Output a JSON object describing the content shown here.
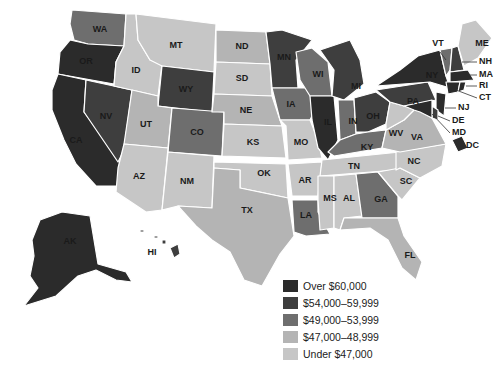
{
  "map": {
    "type": "choropleth",
    "region": "United States",
    "legend": [
      {
        "label": "Over $60,000",
        "color": "#2b2b2b"
      },
      {
        "label": "$54,000–59,999",
        "color": "#3e3e3e"
      },
      {
        "label": "$49,000–53,999",
        "color": "#6e6e6e"
      },
      {
        "label": "$47,000–48,999",
        "color": "#b4b4b4"
      },
      {
        "label": "Under $47,000",
        "color": "#c6c6c6"
      }
    ],
    "states": {
      "WA": 2,
      "OR": 0,
      "CA": 0,
      "NV": 1,
      "ID": 4,
      "MT": 4,
      "WY": 1,
      "UT": 3,
      "AZ": 4,
      "CO": 2,
      "NM": 4,
      "ND": 3,
      "SD": 4,
      "NE": 3,
      "KS": 4,
      "OK": 4,
      "TX": 3,
      "MN": 1,
      "IA": 2,
      "MO": 4,
      "AR": 4,
      "LA": 2,
      "WI": 2,
      "IL": 0,
      "MI": 1,
      "IN": 2,
      "OH": 1,
      "KY": 2,
      "TN": 4,
      "MS": 4,
      "AL": 4,
      "GA": 2,
      "FL": 3,
      "SC": 4,
      "NC": 4,
      "VA": 3,
      "WV": 4,
      "PA": 1,
      "NY": 0,
      "VT": 2,
      "NH": 1,
      "ME": 4,
      "MA": 0,
      "RI": 0,
      "CT": 0,
      "NJ": 0,
      "DE": 1,
      "MD": 0,
      "DC": 0,
      "AK": 0,
      "HI": 1
    },
    "labels": {
      "WA": "WA",
      "OR": "OR",
      "CA": "CA",
      "NV": "NV",
      "ID": "ID",
      "MT": "MT",
      "WY": "WY",
      "UT": "UT",
      "AZ": "AZ",
      "CO": "CO",
      "NM": "NM",
      "ND": "ND",
      "SD": "SD",
      "NE": "NE",
      "KS": "KS",
      "OK": "OK",
      "TX": "TX",
      "MN": "MN",
      "IA": "IA",
      "MO": "MO",
      "AR": "AR",
      "LA": "LA",
      "WI": "WI",
      "IL": "IL",
      "MI": "MI",
      "IN": "IN",
      "OH": "OH",
      "KY": "KY",
      "TN": "TN",
      "MS": "MS",
      "AL": "AL",
      "GA": "GA",
      "FL": "FL",
      "SC": "SC",
      "NC": "NC",
      "VA": "VA",
      "WV": "WV",
      "PA": "PA",
      "NY": "NY",
      "VT": "VT",
      "NH": "NH",
      "ME": "ME",
      "MA": "MA",
      "RI": "RI",
      "CT": "CT",
      "NJ": "NJ",
      "DE": "DE",
      "MD": "MD",
      "DC": "DC",
      "AK": "AK",
      "HI": "HI"
    }
  }
}
